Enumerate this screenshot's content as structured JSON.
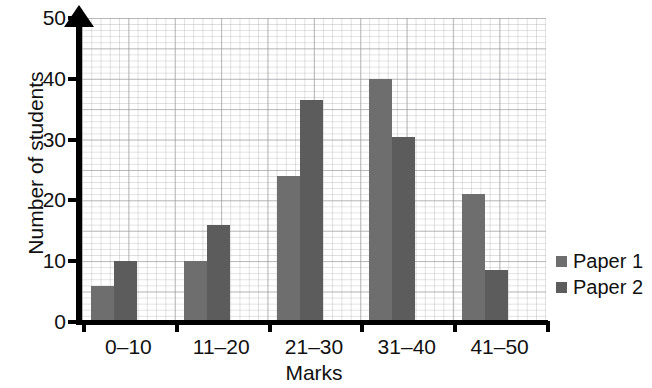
{
  "chart_data": {
    "type": "bar",
    "title": "",
    "xlabel": "Marks",
    "ylabel": "Number of students",
    "categories": [
      "0–10",
      "11–20",
      "21–30",
      "31–40",
      "41–50"
    ],
    "series": [
      {
        "name": "Paper 1",
        "values": [
          6,
          10,
          24,
          40,
          21
        ],
        "color": "#6e6e6e"
      },
      {
        "name": "Paper 2",
        "values": [
          10,
          16,
          36.5,
          30.5,
          8.5
        ],
        "color": "#5c5c5c"
      }
    ],
    "ylim": [
      0,
      55
    ],
    "y_ticks": [
      0,
      10,
      20,
      30,
      40,
      50
    ],
    "y_tick_labels": [
      "0",
      "10",
      "20",
      "30",
      "40",
      "50"
    ],
    "grid": true,
    "grid_style": "graph-paper",
    "legend_position": "right"
  },
  "axes": {
    "y_title": "Number of students",
    "x_title": "Marks",
    "y_arrow": "up-arrow-icon"
  },
  "legend": {
    "items": [
      {
        "label": "Paper 1",
        "swatch": "paper-1-swatch"
      },
      {
        "label": "Paper 2",
        "swatch": "paper-2-swatch"
      }
    ]
  }
}
